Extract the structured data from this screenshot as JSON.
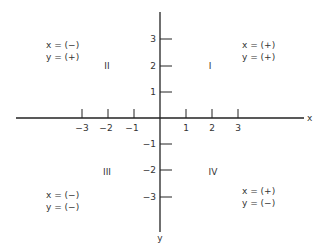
{
  "diagram": {
    "axes": {
      "x_label": "x",
      "y_label": "y",
      "x_ticks": [
        "-3",
        "-2",
        "-1",
        "1",
        "2",
        "3"
      ],
      "y_ticks": [
        "3",
        "2",
        "1",
        "-1",
        "-2",
        "-3"
      ]
    },
    "quadrants": [
      {
        "numeral": "I",
        "x_sign": "x = (+)",
        "y_sign": "y = (+)"
      },
      {
        "numeral": "II",
        "x_sign": "x = (−)",
        "y_sign": "y = (+)"
      },
      {
        "numeral": "III",
        "x_sign": "x = (−)",
        "y_sign": "y = (−)"
      },
      {
        "numeral": "IV",
        "x_sign": "x = (+)",
        "y_sign": "y = (−)"
      }
    ],
    "colors": {
      "line": "#222222",
      "text": "#333333",
      "background": "#ffffff"
    }
  }
}
